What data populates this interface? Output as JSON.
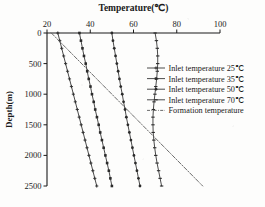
{
  "chart_data": {
    "type": "line",
    "title": "Temperature(℃)",
    "xlabel": "Temperature(℃)",
    "ylabel": "Depth(m)",
    "xlim": [
      20,
      100
    ],
    "ylim": [
      0,
      2500
    ],
    "y_inverted": true,
    "x_axis_position": "top",
    "grid": false,
    "legend_position": "center right",
    "xticks": [
      20,
      40,
      60,
      80,
      100
    ],
    "xticklabels": [
      "20",
      "40",
      "60",
      "80",
      "100"
    ],
    "yticks": [
      0,
      500,
      1000,
      1500,
      2000,
      2500
    ],
    "yticklabels": [
      "0",
      "500",
      "1000",
      "1500",
      "2000",
      "2500"
    ],
    "colors": {
      "line": "#2b2b2b",
      "axis": "#1a1a1a",
      "formation": "#5a5a5a",
      "background": "#fdfdfc"
    },
    "x_key": "depth_m",
    "series": [
      {
        "name": "Inlet temperature 25℃",
        "label": "Inlet temperature 25℃",
        "marker": "plus",
        "linestyle": "solid",
        "depth_m": [
          0,
          125,
          250,
          375,
          500,
          625,
          750,
          875,
          1000,
          1125,
          1250,
          1375,
          1500,
          1625,
          1750,
          1875,
          2000,
          2125,
          2250,
          2375,
          2500
        ],
        "values": [
          25.0,
          25.9,
          26.8,
          27.7,
          28.6,
          29.5,
          30.4,
          31.3,
          32.2,
          33.1,
          34.0,
          34.9,
          35.8,
          36.7,
          37.6,
          38.5,
          39.4,
          40.3,
          41.2,
          42.1,
          43.0
        ]
      },
      {
        "name": "Inlet temperature 35℃",
        "label": "Inlet temperature 35℃",
        "marker": "square",
        "linestyle": "solid",
        "depth_m": [
          0,
          125,
          250,
          375,
          500,
          625,
          750,
          875,
          1000,
          1125,
          1250,
          1375,
          1500,
          1625,
          1750,
          1875,
          2000,
          2125,
          2250,
          2375,
          2500
        ],
        "values": [
          35.0,
          35.7,
          36.4,
          37.1,
          37.9,
          38.6,
          39.3,
          40.1,
          40.8,
          41.6,
          42.3,
          43.1,
          43.9,
          44.6,
          45.4,
          46.2,
          47.0,
          47.8,
          48.6,
          49.3,
          50.0
        ]
      },
      {
        "name": "Inlet temperature 50℃",
        "label": "Inlet temperature 50℃",
        "marker": "circle",
        "linestyle": "solid",
        "depth_m": [
          0,
          125,
          250,
          375,
          500,
          625,
          750,
          875,
          1000,
          1125,
          1250,
          1375,
          1500,
          1625,
          1750,
          1875,
          2000,
          2125,
          2250,
          2375,
          2500
        ],
        "values": [
          50.0,
          50.5,
          51.1,
          51.7,
          52.3,
          52.9,
          53.5,
          54.1,
          54.8,
          55.4,
          56.1,
          56.7,
          57.4,
          58.1,
          58.8,
          59.5,
          60.2,
          60.9,
          61.6,
          62.3,
          63.0
        ]
      },
      {
        "name": "Inlet temperature 70℃",
        "label": "Inlet temperature 70℃",
        "marker": "dash",
        "linestyle": "solid",
        "depth_m": [
          0,
          125,
          250,
          375,
          500,
          625,
          750,
          875,
          1000,
          1125,
          1250,
          1375,
          1500,
          1625,
          1750,
          1875,
          2000,
          2125,
          2250,
          2375,
          2500
        ],
        "values": [
          70.0,
          70.6,
          71.0,
          71.2,
          71.2,
          71.0,
          70.7,
          70.3,
          69.9,
          69.5,
          69.2,
          69.0,
          69.0,
          69.1,
          69.4,
          69.8,
          70.3,
          70.9,
          71.6,
          72.3,
          73.0
        ]
      },
      {
        "name": "Formation temperature",
        "label": "Formation temperature",
        "marker": "none",
        "linestyle": "dashdot",
        "depth_m": [
          0,
          2500
        ],
        "values": [
          22.0,
          92.0
        ]
      }
    ]
  }
}
